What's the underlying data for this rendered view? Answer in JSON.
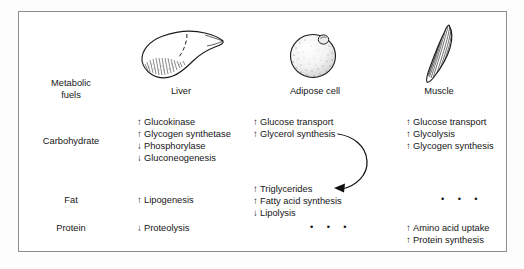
{
  "figure": {
    "row_header_label": {
      "line1": "Metabolic",
      "line2": "fuels"
    },
    "columns": [
      {
        "id": "liver",
        "caption": "Liver",
        "icon": "liver-illustration"
      },
      {
        "id": "adipose",
        "caption": "Adipose cell",
        "icon": "adipose-cell-illustration"
      },
      {
        "id": "muscle",
        "caption": "Muscle",
        "icon": "muscle-illustration"
      }
    ],
    "rows": [
      {
        "id": "carbohydrate",
        "label": "Carbohydrate",
        "cells": {
          "liver": [
            {
              "direction": "↑",
              "text": "Glucokinase"
            },
            {
              "direction": "↑",
              "text": "Glycogen synthetase"
            },
            {
              "direction": "↓",
              "text": "Phosphorylase"
            },
            {
              "direction": "↓",
              "text": "Gluconeogenesis"
            }
          ],
          "adipose": [
            {
              "direction": "↑",
              "text": "Glucose transport"
            },
            {
              "direction": "↑",
              "text": "Glycerol synthesis"
            }
          ],
          "muscle": [
            {
              "direction": "↑",
              "text": "Glucose transport"
            },
            {
              "direction": "↑",
              "text": "Glycolysis"
            },
            {
              "direction": "↑",
              "text": "Glycogen synthesis"
            }
          ]
        }
      },
      {
        "id": "fat",
        "label": "Fat",
        "cells": {
          "liver": [
            {
              "direction": "↑",
              "text": "Lipogenesis"
            }
          ],
          "adipose": [
            {
              "direction": "↑",
              "text": "Triglycerides"
            },
            {
              "direction": "↑",
              "text": "Fatty acid synthesis"
            },
            {
              "direction": "↓",
              "text": "Lipolysis"
            }
          ],
          "muscle": [
            {
              "ellipsis": "•  •  •"
            }
          ]
        }
      },
      {
        "id": "protein",
        "label": "Protein",
        "cells": {
          "liver": [
            {
              "direction": "↓",
              "text": "Proteolysis"
            }
          ],
          "adipose": [
            {
              "ellipsis": "•  •  •"
            }
          ],
          "muscle": [
            {
              "direction": "↑",
              "text": "Amino acid uptake"
            },
            {
              "direction": "↑",
              "text": "Protein synthesis"
            }
          ]
        }
      }
    ],
    "connector": {
      "name": "glycerol-to-triglycerides-arrow",
      "from": "Glycerol synthesis",
      "to": "Triglycerides"
    },
    "colors": {
      "ink": "#161616",
      "frame": "#8d8d8d",
      "page": "#ffffff"
    }
  }
}
